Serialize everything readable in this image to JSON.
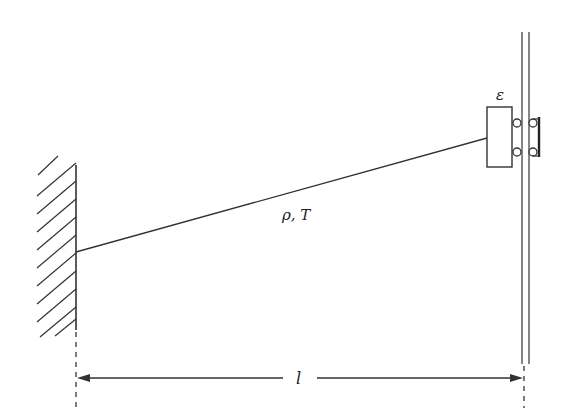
{
  "diagram": {
    "type": "mechanics-schematic",
    "labels": {
      "string_properties": "ρ, T",
      "block": "ε",
      "length": "l"
    },
    "colors": {
      "line": "#333333",
      "background": "#ffffff"
    },
    "components": {
      "left_wall": {
        "kind": "fixed-support-hatched",
        "x": 76,
        "y_top": 165,
        "y_bottom": 330,
        "hatch_count": 10
      },
      "string": {
        "from": [
          76,
          252
        ],
        "to": [
          487,
          138
        ]
      },
      "block": {
        "x": 487,
        "y": 107,
        "width": 25,
        "height": 60
      },
      "rails": [
        {
          "x": 522,
          "y_top": 32,
          "y_bottom": 364
        },
        {
          "x": 529,
          "y_top": 32,
          "y_bottom": 364
        }
      ],
      "rollers": [
        {
          "cx": 517,
          "cy": 123
        },
        {
          "cx": 517,
          "cy": 152
        },
        {
          "cx": 533,
          "cy": 123
        },
        {
          "cx": 533,
          "cy": 152
        }
      ],
      "roller_bar": {
        "x": 539,
        "y_top": 117,
        "y_bottom": 157
      },
      "dimension": {
        "y": 378,
        "x_left": 77,
        "x_right": 524
      }
    }
  }
}
